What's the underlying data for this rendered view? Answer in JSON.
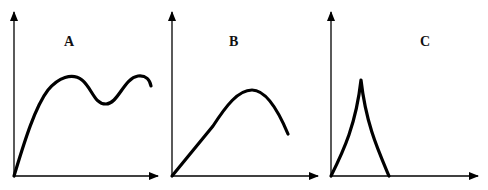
{
  "panels": [
    {
      "label": "A",
      "description": "Curve rising from origin to a peak, dipping, rising to a second peak, then slightly declining",
      "axes": {
        "origin": [
          14,
          176
        ],
        "y_top": 12,
        "x_end": 158
      },
      "curve_path": "M14,176 C22,150 34,108 48,90 C58,78 72,72 82,80 C92,88 94,104 106,104 C118,104 124,78 138,76 C146,75 150,80 151,86",
      "label_pos": [
        64,
        34
      ]
    },
    {
      "label": "B",
      "description": "Curve rising linearly, reaching a single peak, then declining",
      "axes": {
        "origin": [
          172,
          176
        ],
        "y_top": 12,
        "x_end": 318
      },
      "curve_path": "M172,176 L213,126 C226,106 238,90 252,90 C266,90 278,110 288,134",
      "label_pos": [
        229,
        34
      ]
    },
    {
      "label": "C",
      "description": "Sharp spike: rapid concave rise to a cusp peak then rapid fall back to baseline",
      "axes": {
        "origin": [
          331,
          176
        ],
        "y_top": 12,
        "x_end": 478
      },
      "curve_path": "M331,176 C344,150 356,124 361,80 C366,124 378,150 389,176",
      "label_pos": [
        420,
        34
      ]
    }
  ],
  "style": {
    "stroke": "#000000",
    "axis_width": 1.3,
    "curve_width": 3.2
  }
}
